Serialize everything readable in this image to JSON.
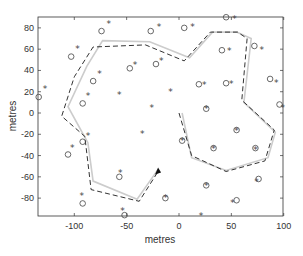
{
  "chart_data": {
    "type": "scatter",
    "title": "",
    "xlabel": "metres",
    "ylabel": "metres",
    "xlim": [
      -135,
      100
    ],
    "ylim": [
      -97,
      90
    ],
    "xticks": [
      -100,
      -50,
      0,
      50,
      100
    ],
    "yticks": [
      -80,
      -60,
      -40,
      -20,
      0,
      20,
      40,
      60,
      80
    ],
    "xtick_labels": [
      "-100",
      "-50",
      "0",
      "50",
      "100"
    ],
    "ytick_labels": [
      "-80",
      "-60",
      "-40",
      "-20",
      "0",
      "20",
      "40",
      "60",
      "80"
    ],
    "grid": false,
    "legend": null,
    "series": [
      {
        "name": "true landmarks",
        "marker": "*",
        "color": "#444444",
        "points": [
          [
            -128,
            23
          ],
          [
            -97,
            61
          ],
          [
            -67,
            84
          ],
          [
            -76,
            37
          ],
          [
            -87,
            16
          ],
          [
            -57,
            17
          ],
          [
            -42,
            46
          ],
          [
            -19,
            81
          ],
          [
            -17,
            49
          ],
          [
            13,
            81
          ],
          [
            -8,
            20
          ],
          [
            -26,
            5
          ],
          [
            -35,
            -19
          ],
          [
            53,
            89
          ],
          [
            48,
            59
          ],
          [
            79,
            60
          ],
          [
            24,
            27
          ],
          [
            50,
            28
          ],
          [
            93,
            29
          ],
          [
            99,
            5
          ],
          [
            26,
            4
          ],
          [
            55,
            -16
          ],
          [
            3,
            -26
          ],
          [
            33,
            -33
          ],
          [
            73,
            -34
          ],
          [
            26,
            -68
          ],
          [
            74,
            -64
          ],
          [
            51,
            -84
          ],
          [
            -13,
            -79
          ],
          [
            21,
            -96
          ],
          [
            -87,
            -21
          ],
          [
            -102,
            -32
          ],
          [
            -56,
            -56
          ],
          [
            -93,
            -78
          ],
          [
            -54,
            -92
          ]
        ]
      },
      {
        "name": "estimated landmarks",
        "marker": "o",
        "color": "#444444",
        "points": [
          [
            -134,
            15
          ],
          [
            -103,
            53
          ],
          [
            -74,
            77
          ],
          [
            -82,
            30
          ],
          [
            -92,
            9
          ],
          [
            -47,
            42
          ],
          [
            -27,
            77
          ],
          [
            -22,
            46
          ],
          [
            5,
            80
          ],
          [
            45,
            90
          ],
          [
            41,
            59
          ],
          [
            72,
            63
          ],
          [
            19,
            27
          ],
          [
            45,
            28
          ],
          [
            87,
            32
          ],
          [
            96,
            8
          ],
          [
            26,
            4
          ],
          [
            55,
            -16
          ],
          [
            3,
            -26
          ],
          [
            33,
            -33
          ],
          [
            73,
            -33
          ],
          [
            26,
            -68
          ],
          [
            76,
            -62
          ],
          [
            55,
            -82
          ],
          [
            -13,
            -80
          ],
          [
            -92,
            -27
          ],
          [
            -106,
            -39
          ],
          [
            -57,
            -60
          ],
          [
            -92,
            -85
          ],
          [
            -52,
            -96
          ]
        ]
      },
      {
        "name": "true path",
        "style": "solid",
        "color": "#cccccc",
        "points": [
          [
            3,
            0
          ],
          [
            12,
            -42
          ],
          [
            45,
            -54
          ],
          [
            85,
            -42
          ],
          [
            92,
            -18
          ],
          [
            62,
            10
          ],
          [
            69,
            70
          ],
          [
            55,
            76
          ],
          [
            32,
            76
          ],
          [
            10,
            52
          ],
          [
            -28,
            67
          ],
          [
            -73,
            68
          ],
          [
            -88,
            44
          ],
          [
            -106,
            6
          ],
          [
            -87,
            -28
          ],
          [
            -82,
            -64
          ],
          [
            -40,
            -81
          ],
          [
            -20,
            -53
          ]
        ]
      },
      {
        "name": "estimated path",
        "style": "dashed",
        "color": "#333333",
        "points": [
          [
            0,
            0
          ],
          [
            12,
            -40
          ],
          [
            45,
            -55
          ],
          [
            82,
            -45
          ],
          [
            91,
            -16
          ],
          [
            60,
            12
          ],
          [
            65,
            70
          ],
          [
            56,
            76
          ],
          [
            30,
            76
          ],
          [
            5,
            49
          ],
          [
            -32,
            64
          ],
          [
            -82,
            62
          ],
          [
            -100,
            34
          ],
          [
            -112,
            -3
          ],
          [
            -90,
            -22
          ],
          [
            -84,
            -72
          ],
          [
            -38,
            -83
          ],
          [
            -20,
            -55
          ]
        ]
      }
    ],
    "annotations": [
      {
        "type": "arrow",
        "at": [
          -20,
          -55
        ],
        "description": "vehicle position/heading"
      }
    ]
  }
}
